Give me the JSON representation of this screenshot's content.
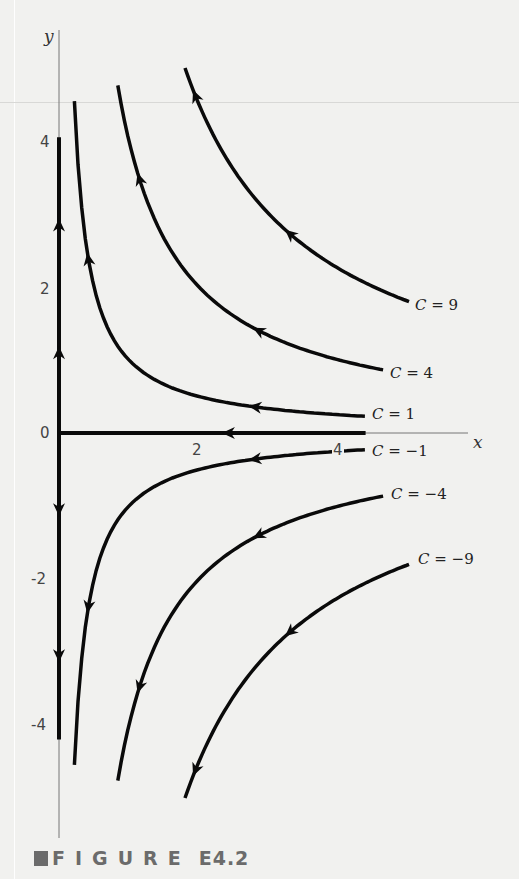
{
  "figure": {
    "caption_word": "FIGURE",
    "caption_number": "E4.2",
    "caption_icon": "square-bullet-icon"
  },
  "chart_data": {
    "type": "line",
    "title": "",
    "xlabel": "x",
    "ylabel": "y",
    "x_ticks": [
      "2",
      "4"
    ],
    "y_ticks": [
      "4",
      "2",
      "0",
      "-2",
      "-4"
    ],
    "origin_label": "0",
    "xlim": [
      0,
      6
    ],
    "ylim": [
      -5.8,
      5.8
    ],
    "axis_mapping": {
      "x0_px": 59,
      "y0_px": 433,
      "px_per_x": 70,
      "px_per_y": 73
    },
    "series": [
      {
        "name": "C = 9",
        "C": 9,
        "label": "C = 9",
        "label_value": "= 9",
        "x_range": [
          1.8,
          5.0
        ],
        "arrow_dir": "left",
        "arrows_at_x": [
          1.95,
          3.3
        ]
      },
      {
        "name": "C = 4",
        "C": 4,
        "label": "C = 4",
        "label_value": "= 4",
        "x_range": [
          0.84,
          4.63
        ],
        "arrow_dir": "left",
        "arrows_at_x": [
          1.15,
          2.85
        ]
      },
      {
        "name": "C = 1",
        "C": 1,
        "label": "C = 1",
        "label_value": "= 1",
        "x_range": [
          0.22,
          4.37
        ],
        "arrow_dir": "left",
        "arrows_at_x": [
          0.42,
          2.8
        ]
      },
      {
        "name": "C = 0 (positive y-axis)",
        "C": 0,
        "segment": "y_pos",
        "y_range": [
          0,
          4.05
        ],
        "arrow_dir": "up",
        "arrows_at_y": [
          1.1,
          2.85
        ]
      },
      {
        "name": "C = 0 (x-axis)",
        "C": 0,
        "segment": "x_pos",
        "x_range": [
          0,
          4.38
        ],
        "arrow_dir": "left",
        "arrows_at_x": [
          2.42
        ]
      },
      {
        "name": "C = 0 (negative y-axis)",
        "C": 0,
        "segment": "y_neg",
        "y_range": [
          -4.2,
          0
        ],
        "arrow_dir": "down",
        "arrows_at_y": [
          -1.05,
          -3.05
        ]
      },
      {
        "name": "C = -1",
        "C": -1,
        "label": "C = −1",
        "label_value": "= −1",
        "x_range": [
          0.22,
          4.37
        ],
        "arrow_dir": "left",
        "arrows_at_x": [
          0.42,
          2.8
        ]
      },
      {
        "name": "C = -4",
        "C": -4,
        "label": "C = −4",
        "label_value": "= −4",
        "x_range": [
          0.84,
          4.63
        ],
        "arrow_dir": "left",
        "arrows_at_x": [
          1.15,
          2.85
        ]
      },
      {
        "name": "C = -9",
        "C": -9,
        "label": "C = −9",
        "label_value": "= −9",
        "x_range": [
          1.8,
          5.0
        ],
        "arrow_dir": "left",
        "arrows_at_x": [
          1.95,
          3.3
        ]
      }
    ],
    "grid": false,
    "legend": "inline labels at right end of each curve"
  },
  "style": {
    "curve_color": "#0a0a0a",
    "axis_thin_color": "#777777",
    "caption_color": "#6b6b6b",
    "background": "#f1f1ef"
  }
}
